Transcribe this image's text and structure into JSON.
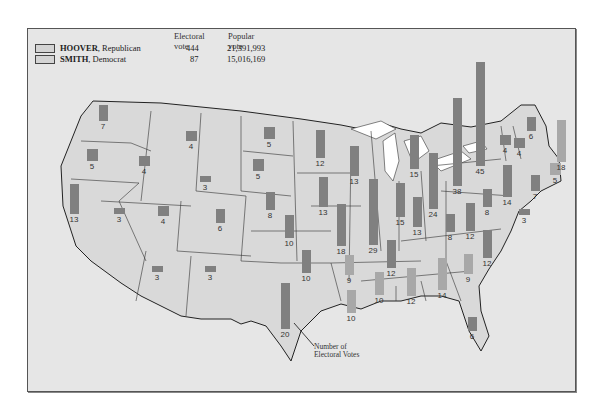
{
  "legend": {
    "col_electoral": "Electoral vote",
    "col_popular": "Popular vote",
    "rows": [
      {
        "name": "HOOVER",
        "party": ", Republican",
        "electoral": "444",
        "popular": "21,391,993",
        "color": "#8a8a8a"
      },
      {
        "name": "SMITH",
        "party": ", Democrat",
        "electoral": "87",
        "popular": "15,016,169",
        "color": "#a9a9a9"
      }
    ]
  },
  "annotation": {
    "line1": "Number of",
    "line2": "Electoral Votes"
  },
  "colors": {
    "map_fill": "#d9d9d9",
    "background": "#e6e6e6",
    "hoover": "#808080",
    "smith": "#a8a8a8",
    "lakes": "#ffffff"
  },
  "chart_data": {
    "type": "map-bar",
    "legend": [
      "HOOVER, Republican",
      "SMITH, Democrat"
    ],
    "totals": {
      "HOOVER": {
        "electoral": 444,
        "popular": 21391993
      },
      "SMITH": {
        "electoral": 87,
        "popular": 15016169
      }
    },
    "states": [
      {
        "state": "WA",
        "votes": 7,
        "winner": "Hoover",
        "x": 102,
        "y": 112
      },
      {
        "state": "OR",
        "votes": 5,
        "winner": "Hoover",
        "x": 91,
        "y": 154
      },
      {
        "state": "CA",
        "votes": 13,
        "winner": "Hoover",
        "x": 73,
        "y": 198
      },
      {
        "state": "ID",
        "votes": 4,
        "winner": "Hoover",
        "x": 143,
        "y": 160
      },
      {
        "state": "NV",
        "votes": 3,
        "winner": "Hoover",
        "x": 118,
        "y": 210
      },
      {
        "state": "MT",
        "votes": 4,
        "winner": "Hoover",
        "x": 190,
        "y": 135
      },
      {
        "state": "WY",
        "votes": 3,
        "winner": "Hoover",
        "x": 204,
        "y": 178
      },
      {
        "state": "UT",
        "votes": 4,
        "winner": "Hoover",
        "x": 162,
        "y": 210
      },
      {
        "state": "CO",
        "votes": 6,
        "winner": "Hoover",
        "x": 219,
        "y": 215
      },
      {
        "state": "AZ",
        "votes": 3,
        "winner": "Hoover",
        "x": 156,
        "y": 268
      },
      {
        "state": "NM",
        "votes": 3,
        "winner": "Hoover",
        "x": 209,
        "y": 268
      },
      {
        "state": "ND",
        "votes": 5,
        "winner": "Hoover",
        "x": 268,
        "y": 132
      },
      {
        "state": "SD",
        "votes": 5,
        "winner": "Hoover",
        "x": 257,
        "y": 164
      },
      {
        "state": "NE",
        "votes": 8,
        "winner": "Hoover",
        "x": 269,
        "y": 200
      },
      {
        "state": "KS",
        "votes": 10,
        "winner": "Hoover",
        "x": 288,
        "y": 225
      },
      {
        "state": "OK",
        "votes": 10,
        "winner": "Hoover",
        "x": 305,
        "y": 260
      },
      {
        "state": "TX",
        "votes": 20,
        "winner": "Hoover",
        "x": 284,
        "y": 305
      },
      {
        "state": "MN",
        "votes": 12,
        "winner": "Hoover",
        "x": 319,
        "y": 143
      },
      {
        "state": "IA",
        "votes": 13,
        "winner": "Hoover",
        "x": 322,
        "y": 191
      },
      {
        "state": "MO",
        "votes": 18,
        "winner": "Hoover",
        "x": 340,
        "y": 224
      },
      {
        "state": "WI",
        "votes": 13,
        "winner": "Hoover",
        "x": 353,
        "y": 160
      },
      {
        "state": "IL",
        "votes": 29,
        "winner": "Hoover",
        "x": 372,
        "y": 211
      },
      {
        "state": "MI",
        "votes": 15,
        "winner": "Hoover",
        "x": 413,
        "y": 151
      },
      {
        "state": "IN",
        "votes": 15,
        "winner": "Hoover",
        "x": 399,
        "y": 199
      },
      {
        "state": "OH",
        "votes": 24,
        "winner": "Hoover",
        "x": 432,
        "y": 180
      },
      {
        "state": "KY",
        "votes": 13,
        "winner": "Hoover",
        "x": 416,
        "y": 211
      },
      {
        "state": "TN",
        "votes": 12,
        "winner": "Hoover",
        "x": 390,
        "y": 253
      },
      {
        "state": "AR",
        "votes": 9,
        "winner": "Smith",
        "x": 348,
        "y": 264
      },
      {
        "state": "LA",
        "votes": 10,
        "winner": "Smith",
        "x": 350,
        "y": 300
      },
      {
        "state": "MS",
        "votes": 10,
        "winner": "Smith",
        "x": 378,
        "y": 282
      },
      {
        "state": "AL",
        "votes": 12,
        "winner": "Smith",
        "x": 410,
        "y": 281
      },
      {
        "state": "GA",
        "votes": 14,
        "winner": "Smith",
        "x": 441,
        "y": 273
      },
      {
        "state": "FL",
        "votes": 6,
        "winner": "Hoover",
        "x": 471,
        "y": 323
      },
      {
        "state": "SC",
        "votes": 9,
        "winner": "Smith",
        "x": 467,
        "y": 263
      },
      {
        "state": "NC",
        "votes": 12,
        "winner": "Hoover",
        "x": 486,
        "y": 243
      },
      {
        "state": "VA",
        "votes": 12,
        "winner": "Hoover",
        "x": 469,
        "y": 216
      },
      {
        "state": "WV",
        "votes": 8,
        "winner": "Hoover",
        "x": 449,
        "y": 222
      },
      {
        "state": "PA",
        "votes": 38,
        "winner": "Hoover",
        "x": 456,
        "y": 141
      },
      {
        "state": "NY",
        "votes": 45,
        "winner": "Hoover",
        "x": 479,
        "y": 113
      },
      {
        "state": "MD",
        "votes": 8,
        "winner": "Hoover",
        "x": 486,
        "y": 197
      },
      {
        "state": "DE",
        "votes": 3,
        "winner": "Hoover",
        "x": 523,
        "y": 211
      },
      {
        "state": "NJ",
        "votes": 14,
        "winner": "Hoover",
        "x": 506,
        "y": 180
      },
      {
        "state": "CT",
        "votes": 7,
        "winner": "Hoover",
        "x": 534,
        "y": 182
      },
      {
        "state": "RI",
        "votes": 5,
        "winner": "Smith",
        "x": 554,
        "y": 168
      },
      {
        "state": "MA",
        "votes": 18,
        "winner": "Smith",
        "x": 560,
        "y": 140
      },
      {
        "state": "VT",
        "votes": 4,
        "winner": "Hoover",
        "x": 504,
        "y": 139
      },
      {
        "state": "NH",
        "votes": 4,
        "winner": "Hoover",
        "x": 518,
        "y": 142
      },
      {
        "state": "ME",
        "votes": 6,
        "winner": "Hoover",
        "x": 530,
        "y": 123
      }
    ]
  }
}
